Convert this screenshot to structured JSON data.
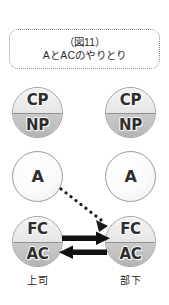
{
  "figure": {
    "title_number": "（図11）",
    "title_text": "AとACのやりとり"
  },
  "columns": [
    {
      "id": "boss",
      "role_label": "上司"
    },
    {
      "id": "subordinate",
      "role_label": "部下"
    }
  ],
  "ego_states": {
    "row1": {
      "top": "CP",
      "bottom": "NP"
    },
    "row2": {
      "single": "A"
    },
    "row3": {
      "top": "FC",
      "bottom": "AC"
    }
  },
  "arrows": [
    {
      "name": "crossed-dotted-arrow",
      "style": "dotted",
      "from": "boss-A",
      "to": "subordinate-FC-AC",
      "direction": "down-right"
    },
    {
      "name": "solid-arrow-right",
      "style": "solid",
      "from": "boss-FC-AC",
      "to": "subordinate-FC-AC",
      "direction": "right"
    },
    {
      "name": "solid-arrow-left",
      "style": "solid",
      "from": "subordinate-FC-AC",
      "to": "boss-FC-AC",
      "direction": "left"
    }
  ],
  "colors": {
    "background": "#ffffff",
    "circle_outline": "#9a9a9a",
    "compartment_light": "#eeeeee",
    "compartment_dark": "#bdbdbd",
    "arrow_solid": "#111111",
    "arrow_dotted": "#1a1a1a",
    "text": "#2b2b2b",
    "title_border": "#8c8c8c"
  }
}
